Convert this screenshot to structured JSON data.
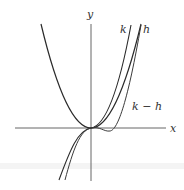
{
  "figure": {
    "axes": {
      "x_label": "x",
      "y_label": "y"
    },
    "curves": [
      {
        "name": "k",
        "label": "k",
        "description": "cubic-like curve, steepest on right"
      },
      {
        "name": "h",
        "label": "h",
        "description": "cubic-like curve with slight dip right of origin"
      },
      {
        "name": "k-h",
        "label": "k − h",
        "description": "parabola with vertex at origin"
      }
    ],
    "colors": {
      "curves": "#2a2a2a",
      "axes": "#555555",
      "background": "#ffffff"
    }
  }
}
